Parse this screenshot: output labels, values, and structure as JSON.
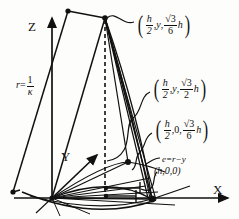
{
  "figure": {
    "background_color": "#fdfdfc",
    "line_color": "#111111"
  },
  "axes": {
    "z_label": "Z",
    "y_label": "Y",
    "x_label": "X"
  },
  "labels": {
    "radius": {
      "lhs": "r",
      "equals": "=",
      "numerator": "1",
      "denominator": "κ"
    },
    "point_top": {
      "open": "(",
      "x_num": "h",
      "x_den": "2",
      "comma1": ",",
      "y": "y",
      "comma2": ",",
      "z_num_radical": "√",
      "z_num_value": "3",
      "z_den": "6",
      "z_suffix": "h",
      "close": ")"
    },
    "point_mid": {
      "open": "(",
      "x_num": "h",
      "x_den": "2",
      "comma1": ",",
      "y": "y",
      "comma2": ",",
      "z_num_radical": "√",
      "z_num_value": "3",
      "z_den": "2",
      "z_suffix": "h",
      "close": ")"
    },
    "point_low": {
      "open": "(",
      "x_num": "h",
      "x_den": "2",
      "comma1": ",",
      "y": "0",
      "comma2": ",",
      "z_num_radical": "√",
      "z_num_value": "3",
      "z_den": "6",
      "z_suffix": "h",
      "close": ")"
    },
    "eccentricity": "e=r−y",
    "point_h": "(h,0,0)"
  }
}
